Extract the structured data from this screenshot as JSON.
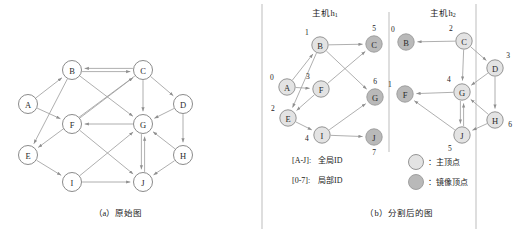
{
  "figure": {
    "panel_a": {
      "caption": "（a）原始图",
      "nodes": [
        {
          "id": "A",
          "x": 28,
          "y": 104
        },
        {
          "id": "B",
          "x": 72,
          "y": 70
        },
        {
          "id": "C",
          "x": 143,
          "y": 70
        },
        {
          "id": "D",
          "x": 183,
          "y": 104
        },
        {
          "id": "E",
          "x": 28,
          "y": 155
        },
        {
          "id": "F",
          "x": 72,
          "y": 124
        },
        {
          "id": "G",
          "x": 143,
          "y": 124
        },
        {
          "id": "H",
          "x": 183,
          "y": 155
        },
        {
          "id": "I",
          "x": 72,
          "y": 182
        },
        {
          "id": "J",
          "x": 143,
          "y": 182
        }
      ],
      "edges": [
        {
          "from": "B",
          "to": "C"
        },
        {
          "from": "C",
          "to": "B"
        },
        {
          "from": "A",
          "to": "B"
        },
        {
          "from": "A",
          "to": "F"
        },
        {
          "from": "B",
          "to": "E"
        },
        {
          "from": "B",
          "to": "G"
        },
        {
          "from": "C",
          "to": "E"
        },
        {
          "from": "C",
          "to": "G"
        },
        {
          "from": "C",
          "to": "D"
        },
        {
          "from": "F",
          "to": "C"
        },
        {
          "from": "F",
          "to": "J"
        },
        {
          "from": "G",
          "to": "F"
        },
        {
          "from": "D",
          "to": "G"
        },
        {
          "from": "D",
          "to": "H"
        },
        {
          "from": "E",
          "to": "I"
        },
        {
          "from": "I",
          "to": "J"
        },
        {
          "from": "I",
          "to": "G"
        },
        {
          "from": "J",
          "to": "G"
        },
        {
          "from": "H",
          "to": "G"
        },
        {
          "from": "H",
          "to": "J"
        },
        {
          "from": "G",
          "to": "J"
        }
      ]
    },
    "panel_b": {
      "caption": "（b）分割后的图",
      "host1": {
        "title": "主机h",
        "title_sub": "1",
        "nodes": [
          {
            "id": "A",
            "local": "0",
            "x": 287,
            "y": 87,
            "kind": "main",
            "label_pos": "left-top"
          },
          {
            "id": "B",
            "local": "1",
            "x": 320,
            "y": 45,
            "kind": "main",
            "label_pos": "top-left"
          },
          {
            "id": "C",
            "local": "5",
            "x": 374,
            "y": 44,
            "kind": "mirror",
            "label_pos": "top"
          },
          {
            "id": "F",
            "local": "3",
            "x": 321,
            "y": 89,
            "kind": "main",
            "label_pos": "top-left"
          },
          {
            "id": "E",
            "local": "2",
            "x": 288,
            "y": 118,
            "kind": "main",
            "label_pos": "left-top"
          },
          {
            "id": "G",
            "local": "6",
            "x": 375,
            "y": 97,
            "kind": "mirror",
            "label_pos": "top"
          },
          {
            "id": "I",
            "local": "4",
            "x": 322,
            "y": 135,
            "kind": "main",
            "label_pos": "left"
          },
          {
            "id": "J",
            "local": "7",
            "x": 374,
            "y": 137,
            "kind": "mirror",
            "label_pos": "bottom"
          }
        ],
        "edges": [
          {
            "from": "B",
            "to": "C"
          },
          {
            "from": "A",
            "to": "B"
          },
          {
            "from": "A",
            "to": "F"
          },
          {
            "from": "B",
            "to": "E"
          },
          {
            "from": "B",
            "to": "G"
          },
          {
            "from": "F",
            "to": "C"
          },
          {
            "from": "F",
            "to": "E"
          },
          {
            "from": "E",
            "to": "I"
          },
          {
            "from": "I",
            "to": "J"
          },
          {
            "from": "I",
            "to": "G"
          }
        ]
      },
      "host2": {
        "title": "主机h",
        "title_sub": "2",
        "nodes": [
          {
            "id": "B",
            "local": "0",
            "x": 406,
            "y": 42,
            "kind": "mirror",
            "label_pos": "top-left"
          },
          {
            "id": "C",
            "local": "2",
            "x": 464,
            "y": 41,
            "kind": "main",
            "label_pos": "top-left"
          },
          {
            "id": "D",
            "local": "3",
            "x": 495,
            "y": 68,
            "kind": "main",
            "label_pos": "top-right"
          },
          {
            "id": "F",
            "local": "1",
            "x": 405,
            "y": 94,
            "kind": "mirror",
            "label_pos": "left-top"
          },
          {
            "id": "G",
            "local": "4",
            "x": 462,
            "y": 92,
            "kind": "main",
            "label_pos": "top-left"
          },
          {
            "id": "H",
            "local": "6",
            "x": 495,
            "y": 120,
            "kind": "main",
            "label_pos": "right"
          },
          {
            "id": "J",
            "local": "5",
            "x": 462,
            "y": 135,
            "kind": "main",
            "label_pos": "bottom-left"
          }
        ],
        "edges": [
          {
            "from": "C",
            "to": "B"
          },
          {
            "from": "C",
            "to": "G"
          },
          {
            "from": "C",
            "to": "D"
          },
          {
            "from": "D",
            "to": "G"
          },
          {
            "from": "D",
            "to": "H"
          },
          {
            "from": "G",
            "to": "F"
          },
          {
            "from": "J",
            "to": "F"
          },
          {
            "from": "J",
            "to": "G"
          },
          {
            "from": "H",
            "to": "G"
          },
          {
            "from": "H",
            "to": "J"
          },
          {
            "from": "G",
            "to": "J"
          }
        ]
      },
      "annotations": [
        {
          "key": "[A-J]:",
          "text": "全局ID",
          "x": 292,
          "y": 160
        },
        {
          "key": "[0-7]:",
          "text": "局部ID",
          "x": 292,
          "y": 180
        }
      ],
      "legend": [
        {
          "kind": "main",
          "text": "：主顶点",
          "x": 416,
          "y": 162
        },
        {
          "kind": "mirror",
          "text": "：镜像顶点",
          "x": 416,
          "y": 182
        }
      ]
    },
    "colors": {
      "main_vertex_fill": "#e3e3e3",
      "mirror_vertex_fill": "#b9b9b9",
      "edge": "#9b9b9b",
      "text": "#1a1a1a"
    }
  }
}
